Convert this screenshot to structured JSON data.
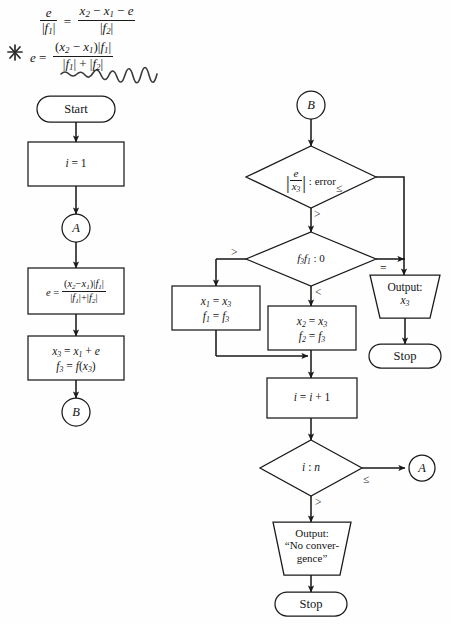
{
  "page": {
    "kind": "scanned-textbook-flowchart",
    "background": "#fefefe",
    "ink": "#1a1a1a"
  },
  "formula": {
    "equation1": {
      "lhs_num": "e",
      "lhs_den": "|f1|",
      "relation": "=",
      "rhs_num": "x2 - x1 - e",
      "rhs_den": "|f2|",
      "plain": "e/|f1| = (x2 - x1 - e)/|f2|"
    },
    "equation2": {
      "lhs": "e",
      "relation": "=",
      "rhs_num": "(x2 - x1)|f1|",
      "rhs_den": "|f1| + |f2|",
      "plain": "e = (x2 - x1)|f1| / (|f1| + |f2|)"
    },
    "annotations": {
      "star_mark": "hand-drawn-asterisk",
      "underline": "hand-drawn-squiggle"
    }
  },
  "flowchart": {
    "left_column": {
      "nodes": [
        {
          "id": "start",
          "type": "terminal",
          "label": "Start"
        },
        {
          "id": "init",
          "type": "process",
          "label": "i = 1"
        },
        {
          "id": "connA",
          "type": "connector",
          "label": "A"
        },
        {
          "id": "calc_e",
          "type": "process",
          "label": "e = (x2 - x1)|f1| / (|f1| + |f2|)"
        },
        {
          "id": "calc_x3",
          "type": "process",
          "line1": "x3 = x1 + e",
          "line2": "f3 = f(x3)"
        },
        {
          "id": "connB",
          "type": "connector",
          "label": "B"
        }
      ]
    },
    "right_column": {
      "nodes": [
        {
          "id": "connB2",
          "type": "connector",
          "label": "B"
        },
        {
          "id": "dec_error",
          "type": "decision",
          "label": "|e/x3| : error",
          "branch_right": "≤",
          "branch_down": ">"
        },
        {
          "id": "dec_sign",
          "type": "decision",
          "label": "f3f1 : 0",
          "branch_left": ">",
          "branch_down": "<",
          "branch_right": "="
        },
        {
          "id": "upd_x1",
          "type": "process",
          "line1": "x1 = x3",
          "line2": "f1 = f3"
        },
        {
          "id": "upd_x2",
          "type": "process",
          "line1": "x2 = x3",
          "line2": "f2 = f3"
        },
        {
          "id": "out_x3",
          "type": "output",
          "line1": "Output:",
          "line2": "x3"
        },
        {
          "id": "stop1",
          "type": "terminal",
          "label": "Stop"
        },
        {
          "id": "incr_i",
          "type": "process",
          "label": "i = i + 1"
        },
        {
          "id": "dec_iter",
          "type": "decision",
          "label": "i : n",
          "branch_right": "≤",
          "branch_down": ">"
        },
        {
          "id": "connA2",
          "type": "connector",
          "label": "A"
        },
        {
          "id": "out_noconv",
          "type": "output",
          "line1": "Output:",
          "line2": "“No conver-",
          "line3": "gence”"
        },
        {
          "id": "stop2",
          "type": "terminal",
          "label": "Stop"
        }
      ]
    }
  }
}
